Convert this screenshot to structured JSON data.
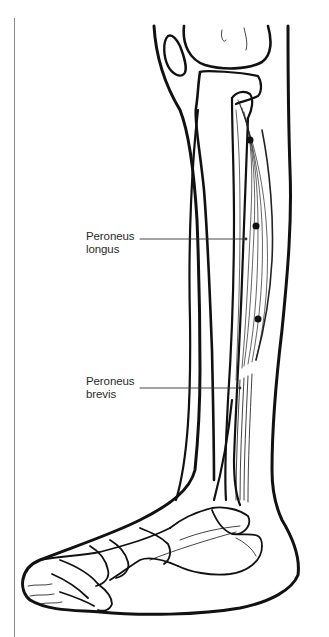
{
  "figure": {
    "labels": [
      {
        "id": "peroneus-longus",
        "line1": "Peroneus",
        "line2": "longus"
      },
      {
        "id": "peroneus-brevis",
        "line1": "Peroneus",
        "line2": "brevis"
      }
    ],
    "markers": 3,
    "colors": {
      "line": "#111111",
      "label_text": "#2a2a2a",
      "leader": "#333333",
      "margin_rule": "#8a8a8a",
      "background": "#ffffff"
    }
  }
}
